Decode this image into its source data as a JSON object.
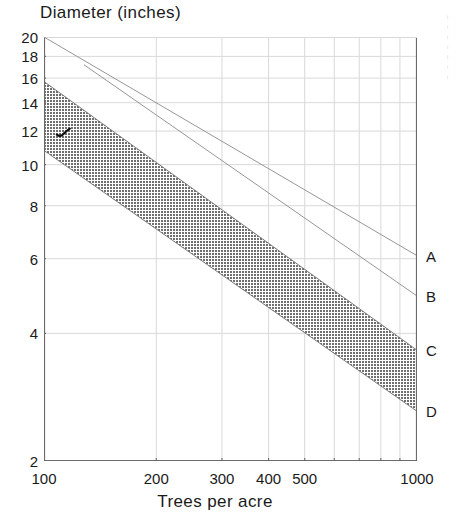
{
  "chart_data": {
    "type": "line",
    "title": "Diameter (inches)",
    "xlabel": "Trees per acre",
    "ylabel": "Diameter (inches)",
    "xscale": "log",
    "yscale": "log",
    "xlim": [
      100,
      1000
    ],
    "ylim": [
      2,
      20
    ],
    "grid": true,
    "legend_position": "right-edge-labels",
    "xticks": [
      {
        "value": 100,
        "label": "100"
      },
      {
        "value": 200,
        "label": "200"
      },
      {
        "value": 300,
        "label": "300"
      },
      {
        "value": 400,
        "label": "400"
      },
      {
        "value": 500,
        "label": "500"
      },
      {
        "value": 1000,
        "label": "1000"
      }
    ],
    "xgridlines": [
      200,
      300,
      400,
      500,
      600,
      700,
      800,
      900,
      1000
    ],
    "yticks": [
      {
        "value": 20,
        "label": "20"
      },
      {
        "value": 18,
        "label": "18"
      },
      {
        "value": 16,
        "label": "16"
      },
      {
        "value": 14,
        "label": "14"
      },
      {
        "value": 12,
        "label": "12"
      },
      {
        "value": 10,
        "label": "10"
      },
      {
        "value": 8,
        "label": "8"
      },
      {
        "value": 6,
        "label": "6"
      },
      {
        "value": 4,
        "label": "4"
      },
      {
        "value": 2,
        "label": "2"
      }
    ],
    "ygridlines": [
      20,
      18,
      16,
      14,
      12,
      10,
      8,
      6,
      4,
      2
    ],
    "series": [
      {
        "name": "A",
        "label": "A",
        "style": "thin-line",
        "color": "#8a8a8a",
        "x": [
          100,
          1000
        ],
        "y": [
          20.0,
          6.1
        ]
      },
      {
        "name": "B",
        "label": "B",
        "style": "thin-line",
        "color": "#8a8a8a",
        "x": [
          100,
          1000
        ],
        "y": [
          20.0,
          4.9
        ],
        "x_start_visible": 128
      },
      {
        "name": "C",
        "label": "C",
        "style": "band-upper",
        "color": "#6e6e6e",
        "x": [
          100,
          1000
        ],
        "y": [
          15.7,
          3.65
        ]
      },
      {
        "name": "D",
        "label": "D",
        "style": "band-lower",
        "color": "#6e6e6e",
        "x": [
          100,
          1000
        ],
        "y": [
          10.8,
          2.62
        ]
      }
    ],
    "shaded_band": {
      "between": [
        "C",
        "D"
      ],
      "fill": "#7a7a7a",
      "description": "stippled grey band bounded above by curve C and below by curve D"
    },
    "annotations": [
      {
        "name": "check-mark",
        "text": "",
        "x": 113,
        "y": 11.9,
        "color": "#111111",
        "description": "small hand-drawn check / tick mark inside the shaded band"
      }
    ]
  },
  "axis": {
    "line_color": "#6b6b6b",
    "grid_color": "#d9d9d9"
  },
  "margin_notes": [
    "i",
    "i",
    "i",
    "i",
    "i",
    "i",
    "i"
  ]
}
